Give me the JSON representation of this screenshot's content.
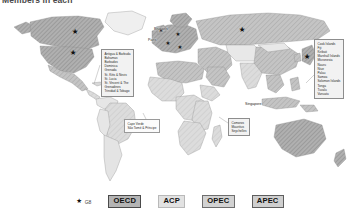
{
  "header": {
    "title": "Members in each"
  },
  "map": {
    "title": "World map of international organisation membership",
    "background_color": "#ffffff",
    "ocean_color": "#ffffff",
    "land_default_color": "#efefef",
    "land_border_color": "#8f8f8f",
    "fill_oecd": "#b0b0b0",
    "fill_acp": "#dcdcdc",
    "fill_opec": "#c9c9c9",
    "fill_apec": "#c4c4c4",
    "star_color": "#111111"
  },
  "city_labels": [
    {
      "name": "brussels",
      "text": "Brussels"
    },
    {
      "name": "paris",
      "text": "Paris"
    },
    {
      "name": "singapore",
      "text": "Singapore"
    }
  ],
  "callouts": {
    "caribbean": {
      "name": "caribbean-islands",
      "items": [
        "Antigua & Barbuda",
        "Bahamas",
        "Barbados",
        "Dominica",
        "Grenada",
        "St. Kitts & Nevis",
        "St. Lucia",
        "St. Vincent & The",
        "Grenadines",
        "Trinidad & Tobago"
      ]
    },
    "pacific": {
      "name": "pacific-islands",
      "items": [
        "Cook Islands",
        "Fiji",
        "Kiribati",
        "Marshall Islands",
        "Micronesia",
        "Nauru",
        "Niue",
        "Palau",
        "Samoa",
        "Solomon Islands",
        "Tonga",
        "Tuvalu",
        "Vanuatu"
      ]
    },
    "atlantic": {
      "name": "atlantic-islands",
      "items": [
        "Cape Verde",
        "São Tomé & Príncipe"
      ]
    },
    "indian": {
      "name": "indian-ocean-islands",
      "items": [
        "Comoros",
        "Mauritius",
        "Seychelles"
      ]
    }
  },
  "legend": {
    "g8": {
      "symbol": "★",
      "label": "G8"
    },
    "chips": [
      {
        "name": "oecd",
        "label": "OECD"
      },
      {
        "name": "acp",
        "label": "ACP"
      },
      {
        "name": "opec",
        "label": "OPEC"
      },
      {
        "name": "apec",
        "label": "APEC"
      }
    ]
  },
  "g8_star_markers": [
    {
      "country": "Canada",
      "x": 75,
      "y": 27
    },
    {
      "country": "United States",
      "x": 73,
      "y": 48
    },
    {
      "country": "Russia",
      "x": 242,
      "y": 25
    },
    {
      "country": "Japan",
      "x": 307,
      "y": 52
    },
    {
      "country": "United Kingdom",
      "x": 168,
      "y": 27
    },
    {
      "country": "France",
      "x": 170,
      "y": 36
    },
    {
      "country": "Germany",
      "x": 177,
      "y": 30
    },
    {
      "country": "Italy",
      "x": 180,
      "y": 41
    }
  ]
}
